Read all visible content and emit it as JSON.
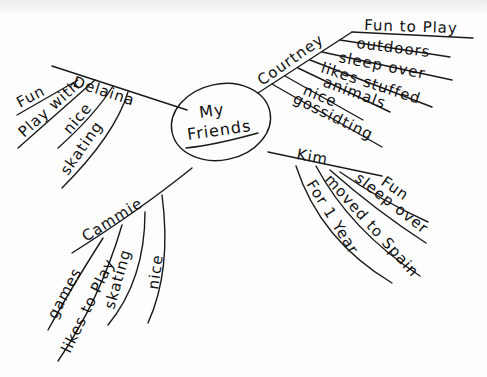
{
  "center": {
    "title_line1": "My",
    "title_line2": "Friends"
  },
  "branches": [
    {
      "name": "Delaina",
      "items": [
        "Fun",
        "Play with",
        "nice",
        "skating"
      ]
    },
    {
      "name": "Courtney",
      "items": [
        "Fun to Play",
        "outdoors",
        "sleep over",
        "likes stuffed",
        "animals",
        "nice",
        "gossidting"
      ]
    },
    {
      "name": "Kim",
      "items": [
        "Fun",
        "sleep over",
        "moved to Spain",
        "For 1 Year"
      ]
    },
    {
      "name": "Cammie",
      "items": [
        "games",
        "likes to Play",
        "skating",
        "nice"
      ]
    }
  ]
}
